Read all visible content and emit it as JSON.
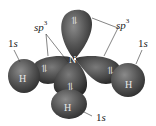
{
  "diagram": {
    "molecule": "NH3",
    "central_atom": "N",
    "central_hybridization": "sp3",
    "colors": {
      "orbital_dark": "#3a3a3a",
      "orbital_mid": "#5e5e5e",
      "orbital_highlight": "#8a8a8a",
      "text": "#222222",
      "symbol_light": "#e8e8e8"
    },
    "labels": {
      "sp3_left": {
        "base": "sp",
        "sup": "3"
      },
      "sp3_right": {
        "base": "sp",
        "sup": "3"
      },
      "s_left": {
        "num": "1",
        "letter": "s"
      },
      "s_right": {
        "num": "1",
        "letter": "s"
      },
      "s_bottom": {
        "num": "1",
        "letter": "s"
      }
    },
    "atoms": {
      "n": "N",
      "h_left": "H",
      "h_right": "H",
      "h_bottom": "H"
    },
    "electron_pairs": {
      "lone_pair": "⥮",
      "bond_left": "⥮",
      "bond_right": "⥮",
      "bond_bottom": "⥮"
    }
  }
}
